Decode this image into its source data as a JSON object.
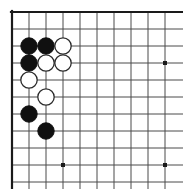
{
  "figure": {
    "kind": "go-board-diagram",
    "board": {
      "visible_columns": 10,
      "visible_rows": 11,
      "origin_x": 12,
      "origin_y": 12,
      "cell_size": 17,
      "edges": {
        "top_border": true,
        "left_border": true,
        "right_border": false,
        "bottom_border": false
      },
      "colors": {
        "line": "#4a4a4a",
        "border": "#1a1a1a",
        "black_stone": "#101010",
        "white_stone_fill": "#ffffff",
        "white_stone_edge": "#2b2b2b",
        "background": "#ffffff",
        "star_point": "#1a1a1a"
      },
      "line_width": 1,
      "border_width": 2.2,
      "stone_radius": 8.2
    },
    "star_points": [
      {
        "col": 4,
        "row": 4
      },
      {
        "col": 10,
        "row": 4
      },
      {
        "col": 4,
        "row": 10
      },
      {
        "col": 10,
        "row": 10
      }
    ],
    "stones": [
      {
        "color": "black",
        "col": 2,
        "row": 3
      },
      {
        "color": "black",
        "col": 3,
        "row": 3
      },
      {
        "color": "white",
        "col": 4,
        "row": 3
      },
      {
        "color": "black",
        "col": 2,
        "row": 4
      },
      {
        "color": "white",
        "col": 3,
        "row": 4
      },
      {
        "color": "white",
        "col": 4,
        "row": 4
      },
      {
        "color": "white",
        "col": 2,
        "row": 5
      },
      {
        "color": "white",
        "col": 3,
        "row": 6
      },
      {
        "color": "black",
        "col": 2,
        "row": 7
      },
      {
        "color": "black",
        "col": 3,
        "row": 8
      }
    ]
  }
}
